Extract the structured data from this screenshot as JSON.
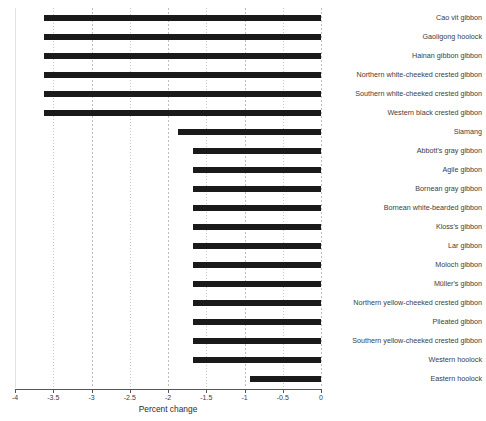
{
  "chart_data": {
    "type": "bar",
    "orientation": "horizontal",
    "title": "",
    "xlabel": "Percent change",
    "ylabel": "",
    "xlim": [
      -4,
      0
    ],
    "ylim": null,
    "grid": true,
    "legend_position": "none",
    "bar_color": "#1a1a1a",
    "xticks": [
      -4,
      -3.5,
      -3,
      -2.5,
      -2,
      -1.5,
      -1,
      -0.5,
      0
    ],
    "xtick_labels": [
      "-4",
      "-3.5",
      "-3",
      "-2.5",
      "-2",
      "-1.5",
      "-1",
      "-0.5",
      "0"
    ],
    "categories": [
      "Cao vit gibbon",
      "Gaoligong hoolock",
      "Hainan gibbon gibbon",
      "Northern white-cheeked crested gibbon",
      "Southern white-cheeked crested gibbon",
      "Western black crested gibbon",
      "Siamang",
      "Abbott's gray gibbon",
      "Agile gibbon",
      "Bornean gray gibbon",
      "Bornean white-bearded gibbon",
      "Kloss's gibbon",
      "Lar gibbon",
      "Moloch gibbon",
      "Müller's gibbon",
      "Northern yellow-cheeked crested gibbon",
      "Pileated gibbon",
      "Southern yellow-cheeked crested gibbon",
      "Western hoolock",
      "Eastern hoolock"
    ],
    "values": [
      -3.62,
      -3.62,
      -3.62,
      -3.62,
      -3.62,
      -3.62,
      -1.87,
      -1.67,
      -1.67,
      -1.67,
      -1.67,
      -1.67,
      -1.67,
      -1.67,
      -1.67,
      -1.67,
      -1.67,
      -1.67,
      -1.67,
      -0.93
    ]
  },
  "axis": {
    "x_label": "Percent change"
  }
}
